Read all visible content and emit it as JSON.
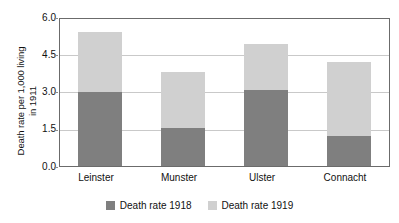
{
  "chart_data": {
    "type": "bar",
    "subtype": "stacked",
    "title": "",
    "xlabel": "",
    "ylabel": "Death rate per 1,000 living in 1911",
    "ylabel_lines": [
      "Death rate per 1,000 living",
      "in 1911"
    ],
    "categories": [
      "Leinster",
      "Munster",
      "Ulster",
      "Connacht"
    ],
    "series": [
      {
        "name": "Death rate 1918",
        "color": "#7f7f7f",
        "values": [
          3.0,
          1.55,
          3.05,
          1.2
        ]
      },
      {
        "name": "Death rate 1919",
        "color": "#d0d0d0",
        "values": [
          2.4,
          2.25,
          1.85,
          3.0
        ]
      }
    ],
    "totals": [
      5.4,
      3.8,
      4.9,
      4.2
    ],
    "ylim": [
      0.0,
      6.0
    ],
    "ytick_values": [
      0.0,
      1.5,
      3.0,
      4.5,
      6.0
    ],
    "ytick_labels": [
      "0.0",
      "1.5",
      "3.0",
      "4.5",
      "6.0"
    ],
    "grid": true,
    "grid_axis": "y",
    "grid_color": "#c9c9c9",
    "legend_position": "bottom-center",
    "plot_border_color": "#6b6b6b",
    "background": "#ffffff"
  },
  "legend": {
    "items": [
      {
        "label": "Death rate 1918",
        "color": "#7f7f7f"
      },
      {
        "label": "Death rate 1919",
        "color": "#d0d0d0"
      }
    ]
  }
}
